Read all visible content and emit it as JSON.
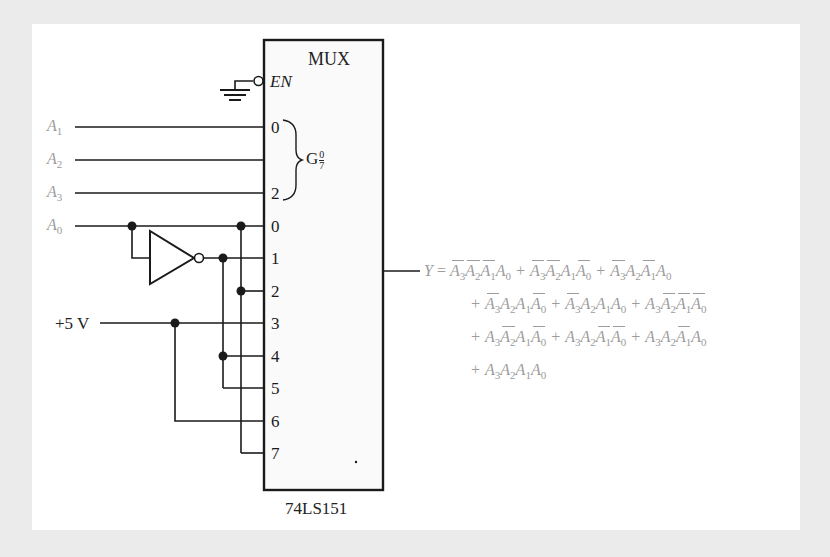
{
  "chip": {
    "title": "MUX",
    "enable_label": "EN",
    "part_number": "74LS151",
    "select_group_label": "G",
    "select_group_sup": "0",
    "select_group_sub": "7",
    "select_pins": [
      "0",
      "",
      "2"
    ],
    "data_pins": [
      "0",
      "1",
      "2",
      "3",
      "4",
      "5",
      "6",
      "7"
    ]
  },
  "inputs": [
    {
      "name": "A",
      "sub": "1"
    },
    {
      "name": "A",
      "sub": "2"
    },
    {
      "name": "A",
      "sub": "3"
    },
    {
      "name": "A",
      "sub": "0"
    }
  ],
  "supply_label": "+5 V",
  "output": {
    "lhs": "Y",
    "equals": "=",
    "plus": "+",
    "lines": [
      [
        [
          [
            "A3",
            1
          ],
          [
            "A2",
            1
          ],
          [
            "A1",
            1
          ],
          [
            "A0",
            0
          ]
        ],
        [
          [
            "A3",
            1
          ],
          [
            "A2",
            1
          ],
          [
            "A1",
            0
          ],
          [
            "A0",
            1
          ]
        ],
        [
          [
            "A3",
            1
          ],
          [
            "A2",
            0
          ],
          [
            "A1",
            1
          ],
          [
            "A0",
            0
          ]
        ]
      ],
      [
        [
          [
            "A3",
            1
          ],
          [
            "A2",
            0
          ],
          [
            "A1",
            0
          ],
          [
            "A0",
            1
          ]
        ],
        [
          [
            "A3",
            1
          ],
          [
            "A2",
            0
          ],
          [
            "A1",
            0
          ],
          [
            "A0",
            0
          ]
        ],
        [
          [
            "A3",
            0
          ],
          [
            "A2",
            1
          ],
          [
            "A1",
            1
          ],
          [
            "A0",
            1
          ]
        ]
      ],
      [
        [
          [
            "A3",
            0
          ],
          [
            "A2",
            1
          ],
          [
            "A1",
            0
          ],
          [
            "A0",
            1
          ]
        ],
        [
          [
            "A3",
            0
          ],
          [
            "A2",
            0
          ],
          [
            "A1",
            1
          ],
          [
            "A0",
            1
          ]
        ],
        [
          [
            "A3",
            0
          ],
          [
            "A2",
            0
          ],
          [
            "A1",
            1
          ],
          [
            "A0",
            0
          ]
        ]
      ],
      [
        [
          [
            "A3",
            0
          ],
          [
            "A2",
            0
          ],
          [
            "A1",
            0
          ],
          [
            "A0",
            0
          ]
        ]
      ]
    ]
  },
  "colors": {
    "background": "#ebebeb",
    "panel": "#ffffff",
    "wire": "#1a1a1a",
    "label_gray": "#9c9c9c"
  }
}
